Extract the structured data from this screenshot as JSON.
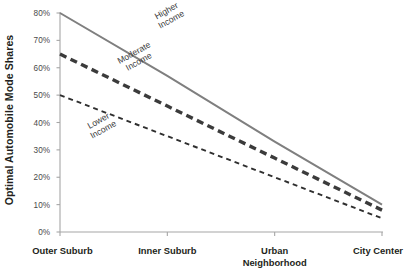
{
  "chart_data": {
    "type": "line",
    "title": "",
    "xlabel": "",
    "ylabel": "Optimal Automobile Mode Shares",
    "categories": [
      "Outer Suburb",
      "Inner Suburb",
      "Urban Neighborhood",
      "City Center"
    ],
    "ytick_labels": [
      "0%",
      "10%",
      "20%",
      "30%",
      "40%",
      "50%",
      "60%",
      "70%",
      "80%"
    ],
    "ytick_values": [
      0,
      10,
      20,
      30,
      40,
      50,
      60,
      70,
      80
    ],
    "ylim": [
      0,
      80
    ],
    "grid": false,
    "legend_position": "inline-annotations",
    "series": [
      {
        "name": "Higher Income",
        "label": "Higher\nIncome",
        "label_line1": "Higher",
        "label_line2": "Income",
        "style": "solid",
        "color": "#7f7f7f",
        "width": 2.0,
        "values": [
          80,
          57,
          33,
          10
        ]
      },
      {
        "name": "Moderate Income",
        "label_line1": "Moderate",
        "label_line2": "Income",
        "style": "long-dash",
        "color": "#3b3b3b",
        "width": 3.4,
        "values": [
          65,
          46,
          27,
          8
        ]
      },
      {
        "name": "Lower Income",
        "label_line1": "Lower",
        "label_line2": "Income",
        "style": "short-dash",
        "color": "#2f2f2f",
        "width": 1.9,
        "values": [
          50,
          35,
          20,
          5
        ]
      }
    ],
    "axis_color": "#a6a6a6"
  },
  "axis": {
    "y_title": "Optimal Automobile Mode Shares"
  }
}
